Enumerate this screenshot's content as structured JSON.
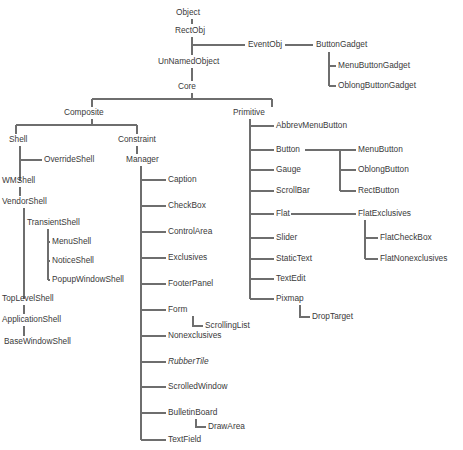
{
  "diagram": {
    "type": "tree",
    "background_color": "#ffffff",
    "line_color": "#6e6e6e",
    "text_color": "#3a3a3a",
    "canvas": {
      "width": 463,
      "height": 450
    },
    "nodes": [
      {
        "id": "object",
        "label": "Object",
        "x": 176,
        "y": 13,
        "anchor": "start",
        "style": "normal"
      },
      {
        "id": "rectobj",
        "label": "RectObj",
        "x": 175,
        "y": 31,
        "anchor": "start",
        "style": "normal"
      },
      {
        "id": "eventobj",
        "label": "EventObj",
        "x": 248,
        "y": 45,
        "anchor": "start",
        "style": "normal"
      },
      {
        "id": "buttongadget",
        "label": "ButtonGadget",
        "x": 316,
        "y": 45,
        "anchor": "start",
        "style": "normal"
      },
      {
        "id": "menubuttongadget",
        "label": "MenuButtonGadget",
        "x": 338,
        "y": 66,
        "anchor": "start",
        "style": "normal"
      },
      {
        "id": "oblongbuttongadget",
        "label": "OblongButtonGadget",
        "x": 338,
        "y": 86,
        "anchor": "start",
        "style": "normal"
      },
      {
        "id": "unnamedobject",
        "label": "UnNamedObject",
        "x": 158,
        "y": 62,
        "anchor": "start",
        "style": "normal"
      },
      {
        "id": "core",
        "label": "Core",
        "x": 178,
        "y": 87,
        "anchor": "start",
        "style": "normal"
      },
      {
        "id": "composite",
        "label": "Composite",
        "x": 64,
        "y": 113,
        "anchor": "start",
        "style": "normal"
      },
      {
        "id": "primitive",
        "label": "Primitive",
        "x": 233,
        "y": 113,
        "anchor": "start",
        "style": "normal"
      },
      {
        "id": "shell",
        "label": "Shell",
        "x": 9,
        "y": 140,
        "anchor": "start",
        "style": "normal"
      },
      {
        "id": "overrideshell",
        "label": "OverrideShell",
        "x": 44,
        "y": 160,
        "anchor": "start",
        "style": "normal"
      },
      {
        "id": "wmshell",
        "label": "WMShell",
        "x": 2,
        "y": 181,
        "anchor": "start",
        "style": "normal"
      },
      {
        "id": "vendorshell",
        "label": "VendorShell",
        "x": 2,
        "y": 202,
        "anchor": "start",
        "style": "normal"
      },
      {
        "id": "transientshell",
        "label": "TransientShell",
        "x": 27,
        "y": 223,
        "anchor": "start",
        "style": "normal"
      },
      {
        "id": "menushell",
        "label": "MenuShell",
        "x": 52,
        "y": 242,
        "anchor": "start",
        "style": "normal"
      },
      {
        "id": "noticeshell",
        "label": "NoticeShell",
        "x": 52,
        "y": 261,
        "anchor": "start",
        "style": "normal"
      },
      {
        "id": "popupwindowshell",
        "label": "PopupWindowShell",
        "x": 52,
        "y": 280,
        "anchor": "start",
        "style": "normal"
      },
      {
        "id": "toplevelshell",
        "label": "TopLevelShell",
        "x": 2,
        "y": 299,
        "anchor": "start",
        "style": "normal"
      },
      {
        "id": "applicationshell",
        "label": "ApplicationShell",
        "x": 2,
        "y": 320,
        "anchor": "start",
        "style": "normal"
      },
      {
        "id": "basewindowshell",
        "label": "BaseWindowShell",
        "x": 4,
        "y": 342,
        "anchor": "start",
        "style": "normal"
      },
      {
        "id": "constraint",
        "label": "Constraint",
        "x": 118,
        "y": 140,
        "anchor": "start",
        "style": "normal"
      },
      {
        "id": "manager",
        "label": "Manager",
        "x": 126,
        "y": 160,
        "anchor": "start",
        "style": "normal"
      },
      {
        "id": "caption",
        "label": "Caption",
        "x": 168,
        "y": 180,
        "anchor": "start",
        "style": "normal"
      },
      {
        "id": "checkbox",
        "label": "CheckBox",
        "x": 168,
        "y": 206,
        "anchor": "start",
        "style": "normal"
      },
      {
        "id": "controlarea",
        "label": "ControlArea",
        "x": 168,
        "y": 232,
        "anchor": "start",
        "style": "normal"
      },
      {
        "id": "exclusives",
        "label": "Exclusives",
        "x": 168,
        "y": 258,
        "anchor": "start",
        "style": "normal"
      },
      {
        "id": "footerpanel",
        "label": "FooterPanel",
        "x": 168,
        "y": 284,
        "anchor": "start",
        "style": "normal"
      },
      {
        "id": "form",
        "label": "Form",
        "x": 168,
        "y": 310,
        "anchor": "start",
        "style": "normal"
      },
      {
        "id": "scrollinglist",
        "label": "ScrollingList",
        "x": 205,
        "y": 326,
        "anchor": "start",
        "style": "normal"
      },
      {
        "id": "nonexclusives",
        "label": "Nonexclusives",
        "x": 168,
        "y": 336,
        "anchor": "start",
        "style": "normal"
      },
      {
        "id": "rubbertile",
        "label": "RubberTile",
        "x": 168,
        "y": 362,
        "anchor": "start",
        "style": "italic"
      },
      {
        "id": "scrolledwindow",
        "label": "ScrolledWindow",
        "x": 168,
        "y": 387,
        "anchor": "start",
        "style": "normal"
      },
      {
        "id": "bulletinboard",
        "label": "BulletinBoard",
        "x": 168,
        "y": 413,
        "anchor": "start",
        "style": "normal"
      },
      {
        "id": "drawarea",
        "label": "DrawArea",
        "x": 208,
        "y": 427,
        "anchor": "start",
        "style": "normal"
      },
      {
        "id": "textfield",
        "label": "TextField",
        "x": 168,
        "y": 440,
        "anchor": "start",
        "style": "normal"
      },
      {
        "id": "abbrevmenubutton",
        "label": "AbbrevMenuButton",
        "x": 276,
        "y": 126,
        "anchor": "start",
        "style": "normal"
      },
      {
        "id": "button",
        "label": "Button",
        "x": 276,
        "y": 150,
        "anchor": "start",
        "style": "normal"
      },
      {
        "id": "gauge",
        "label": "Gauge",
        "x": 276,
        "y": 170,
        "anchor": "start",
        "style": "normal"
      },
      {
        "id": "scrollbar",
        "label": "ScrollBar",
        "x": 276,
        "y": 191,
        "anchor": "start",
        "style": "normal"
      },
      {
        "id": "flat",
        "label": "Flat",
        "x": 276,
        "y": 214,
        "anchor": "start",
        "style": "normal"
      },
      {
        "id": "slider",
        "label": "Slider",
        "x": 276,
        "y": 238,
        "anchor": "start",
        "style": "normal"
      },
      {
        "id": "statictext",
        "label": "StaticText",
        "x": 276,
        "y": 259,
        "anchor": "start",
        "style": "normal"
      },
      {
        "id": "textedit",
        "label": "TextEdit",
        "x": 276,
        "y": 279,
        "anchor": "start",
        "style": "normal"
      },
      {
        "id": "pixmap",
        "label": "Pixmap",
        "x": 276,
        "y": 299,
        "anchor": "start",
        "style": "normal"
      },
      {
        "id": "droptarget",
        "label": "DropTarget",
        "x": 312,
        "y": 317,
        "anchor": "start",
        "style": "normal"
      },
      {
        "id": "menubutton",
        "label": "MenuButton",
        "x": 358,
        "y": 150,
        "anchor": "start",
        "style": "normal"
      },
      {
        "id": "oblongbutton",
        "label": "OblongButton",
        "x": 358,
        "y": 170,
        "anchor": "start",
        "style": "normal"
      },
      {
        "id": "rectbutton",
        "label": "RectButton",
        "x": 358,
        "y": 191,
        "anchor": "start",
        "style": "normal"
      },
      {
        "id": "flatexclusives",
        "label": "FlatExclusives",
        "x": 358,
        "y": 214,
        "anchor": "start",
        "style": "normal"
      },
      {
        "id": "flatcheckbox",
        "label": "FlatCheckBox",
        "x": 380,
        "y": 238,
        "anchor": "start",
        "style": "normal"
      },
      {
        "id": "flatnonexclusives",
        "label": "FlatNonexclusives",
        "x": 380,
        "y": 259,
        "anchor": "start",
        "style": "normal"
      }
    ],
    "edges": [
      {
        "id": "object-rectobj",
        "from": "object",
        "to": "rectobj",
        "path": "M 192 19 L 192 24"
      },
      {
        "id": "rectobj-unnamedobject",
        "from": "rectobj",
        "to": "unnamedobject",
        "path": "M 192 37 L 192 55"
      },
      {
        "id": "rectobj-eventobj",
        "from": "rectobj",
        "to": "eventobj",
        "path": "M 192 45 L 245 45"
      },
      {
        "id": "eventobj-buttongadget",
        "from": "eventobj",
        "to": "buttongadget",
        "path": "M 285 45 L 313 45"
      },
      {
        "id": "buttongadget-trunk",
        "from": "buttongadget",
        "to": "gadget-children",
        "path": "M 329 52 L 329 86"
      },
      {
        "id": "buttongadget-menu",
        "from": "buttongadget",
        "to": "menubuttongadget",
        "path": "M 329 66 L 336 66"
      },
      {
        "id": "buttongadget-oblong",
        "from": "buttongadget",
        "to": "oblongbuttongadget",
        "path": "M 329 86 L 336 86"
      },
      {
        "id": "unnamedobject-core",
        "from": "unnamedobject",
        "to": "core",
        "path": "M 192 68 L 192 81"
      },
      {
        "id": "core-split",
        "from": "core",
        "to": "children",
        "path": "M 192 93 L 192 99 M 92 99 L 272 99 M 92 99 L 92 107 M 272 99 L 272 107"
      },
      {
        "id": "composite-split",
        "from": "composite",
        "to": "children",
        "path": "M 92 119 L 92 125 M 16 125 L 137 125 M 16 125 L 16 134 M 137 125 L 137 134"
      },
      {
        "id": "shell-trunk",
        "from": "shell",
        "to": "shell-children",
        "path": "M 20 146 L 20 181"
      },
      {
        "id": "shell-override",
        "from": "shell",
        "to": "overrideshell",
        "path": "M 20 160 L 42 160"
      },
      {
        "id": "wmshell-vendorshell",
        "from": "wmshell",
        "to": "vendorshell",
        "path": "M 20 187 L 20 196"
      },
      {
        "id": "vendorshell-trunk",
        "from": "vendorshell",
        "to": "vs-children",
        "path": "M 24 208 L 24 299"
      },
      {
        "id": "vendorshell-transient",
        "from": "vendorshell",
        "to": "transientshell",
        "path": "M 24 223 L 25 223"
      },
      {
        "id": "transient-trunk",
        "from": "transientshell",
        "to": "ts-children",
        "path": "M 48 229 L 48 280"
      },
      {
        "id": "transient-menushell",
        "from": "transientshell",
        "to": "menushell",
        "path": "M 48 242 L 50 242"
      },
      {
        "id": "transient-noticeshell",
        "from": "transientshell",
        "to": "noticeshell",
        "path": "M 48 261 L 50 261"
      },
      {
        "id": "transient-popupshell",
        "from": "transientshell",
        "to": "popupwindowshell",
        "path": "M 48 280 L 50 280"
      },
      {
        "id": "toplevel-application",
        "from": "toplevelshell",
        "to": "applicationshell",
        "path": "M 24 305 L 24 314"
      },
      {
        "id": "application-basewindow",
        "from": "applicationshell",
        "to": "basewindowshell",
        "path": "M 24 326 L 24 336"
      },
      {
        "id": "constraint-manager",
        "from": "constraint",
        "to": "manager",
        "path": "M 137 146 L 137 154"
      },
      {
        "id": "manager-trunk",
        "from": "manager",
        "to": "mgr-children",
        "path": "M 141 166 L 141 440"
      },
      {
        "id": "manager-caption",
        "from": "manager",
        "to": "caption",
        "path": "M 141 180 L 166 180"
      },
      {
        "id": "manager-checkbox",
        "from": "manager",
        "to": "checkbox",
        "path": "M 141 206 L 166 206"
      },
      {
        "id": "manager-controlarea",
        "from": "manager",
        "to": "controlarea",
        "path": "M 141 232 L 166 232"
      },
      {
        "id": "manager-exclusives",
        "from": "manager",
        "to": "exclusives",
        "path": "M 141 258 L 166 258"
      },
      {
        "id": "manager-footerpanel",
        "from": "manager",
        "to": "footerpanel",
        "path": "M 141 284 L 166 284"
      },
      {
        "id": "manager-form",
        "from": "manager",
        "to": "form",
        "path": "M 141 310 L 166 310"
      },
      {
        "id": "form-scrollinglist",
        "from": "form",
        "to": "scrollinglist",
        "path": "M 193 316 L 193 326 L 203 326"
      },
      {
        "id": "manager-nonexclusives",
        "from": "manager",
        "to": "nonexclusives",
        "path": "M 141 336 L 166 336"
      },
      {
        "id": "manager-rubbertile",
        "from": "manager",
        "to": "rubbertile",
        "path": "M 141 362 L 166 362"
      },
      {
        "id": "manager-scrolledwindow",
        "from": "manager",
        "to": "scrolledwindow",
        "path": "M 141 387 L 166 387"
      },
      {
        "id": "manager-bulletinboard",
        "from": "manager",
        "to": "bulletinboard",
        "path": "M 141 413 L 166 413"
      },
      {
        "id": "bulletin-drawarea",
        "from": "bulletinboard",
        "to": "drawarea",
        "path": "M 196 419 L 196 427 L 206 427"
      },
      {
        "id": "manager-textfield",
        "from": "manager",
        "to": "textfield",
        "path": "M 141 440 L 166 440"
      },
      {
        "id": "primitive-trunk",
        "from": "primitive",
        "to": "prim-children",
        "path": "M 250 119 L 250 299"
      },
      {
        "id": "primitive-abbrev",
        "from": "primitive",
        "to": "abbrevmenubutton",
        "path": "M 250 126 L 274 126"
      },
      {
        "id": "primitive-button",
        "from": "primitive",
        "to": "button",
        "path": "M 250 150 L 274 150"
      },
      {
        "id": "primitive-gauge",
        "from": "primitive",
        "to": "gauge",
        "path": "M 250 170 L 274 170"
      },
      {
        "id": "primitive-scrollbar",
        "from": "primitive",
        "to": "scrollbar",
        "path": "M 250 191 L 274 191"
      },
      {
        "id": "primitive-flat",
        "from": "primitive",
        "to": "flat",
        "path": "M 250 214 L 274 214"
      },
      {
        "id": "primitive-slider",
        "from": "primitive",
        "to": "slider",
        "path": "M 250 238 L 274 238"
      },
      {
        "id": "primitive-statictext",
        "from": "primitive",
        "to": "statictext",
        "path": "M 250 259 L 274 259"
      },
      {
        "id": "primitive-textedit",
        "from": "primitive",
        "to": "textedit",
        "path": "M 250 279 L 274 279"
      },
      {
        "id": "primitive-pixmap",
        "from": "primitive",
        "to": "pixmap",
        "path": "M 250 299 L 274 299"
      },
      {
        "id": "pixmap-droptarget",
        "from": "pixmap",
        "to": "droptarget",
        "path": "M 300 305 L 300 317 L 310 317"
      },
      {
        "id": "button-branch",
        "from": "button",
        "to": "btn-children",
        "path": "M 305 150 L 340 150 M 340 150 L 340 191"
      },
      {
        "id": "button-menubutton",
        "from": "button",
        "to": "menubutton",
        "path": "M 340 150 L 356 150"
      },
      {
        "id": "button-oblongbutton",
        "from": "button",
        "to": "oblongbutton",
        "path": "M 340 170 L 356 170"
      },
      {
        "id": "button-rectbutton",
        "from": "button",
        "to": "rectbutton",
        "path": "M 340 191 L 356 191"
      },
      {
        "id": "flat-flatexclusives",
        "from": "flat",
        "to": "flatexclusives",
        "path": "M 291 214 L 356 214"
      },
      {
        "id": "flatexclusives-trunk",
        "from": "flatexclusives",
        "to": "fe-children",
        "path": "M 365 220 L 365 259"
      },
      {
        "id": "flatex-flatcheckbox",
        "from": "flatexclusives",
        "to": "flatcheckbox",
        "path": "M 365 238 L 378 238"
      },
      {
        "id": "flatex-flatnonexclusives",
        "from": "flatexclusives",
        "to": "flatnonexclusives",
        "path": "M 365 259 L 378 259"
      }
    ]
  }
}
